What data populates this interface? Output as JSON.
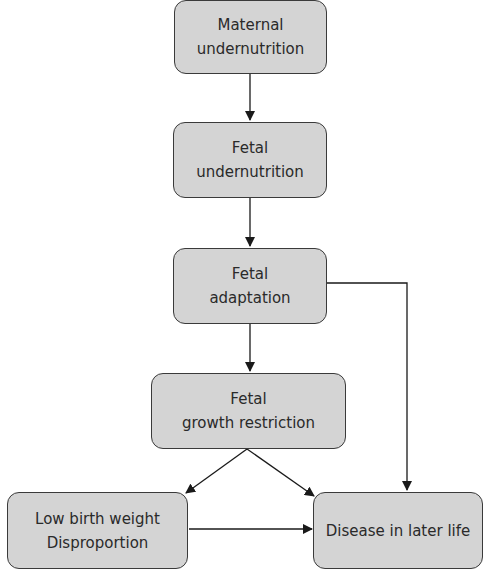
{
  "nodes": {
    "maternal_undernutrition": {
      "line1": "Maternal",
      "line2": "undernutrition"
    },
    "fetal_undernutrition": {
      "line1": "Fetal",
      "line2": "undernutrition"
    },
    "fetal_adaptation": {
      "line1": "Fetal",
      "line2": "adaptation"
    },
    "fetal_growth_restriction": {
      "line1": "Fetal",
      "line2": "growth restriction"
    },
    "low_birth_weight": {
      "line1": "Low birth weight",
      "line2": "Disproportion"
    },
    "disease_later_life": {
      "line1": "Disease in later life"
    }
  },
  "edges": [
    {
      "from": "Maternal undernutrition",
      "to": "Fetal undernutrition"
    },
    {
      "from": "Fetal undernutrition",
      "to": "Fetal adaptation"
    },
    {
      "from": "Fetal adaptation",
      "to": "Fetal growth restriction"
    },
    {
      "from": "Fetal adaptation",
      "to": "Disease in later life"
    },
    {
      "from": "Fetal growth restriction",
      "to": "Low birth weight / Disproportion"
    },
    {
      "from": "Fetal growth restriction",
      "to": "Disease in later life"
    },
    {
      "from": "Low birth weight / Disproportion",
      "to": "Disease in later life"
    }
  ],
  "colors": {
    "node_fill": "#d4d4d4",
    "stroke": "#3a3a3a",
    "text": "#2a2a2a"
  }
}
